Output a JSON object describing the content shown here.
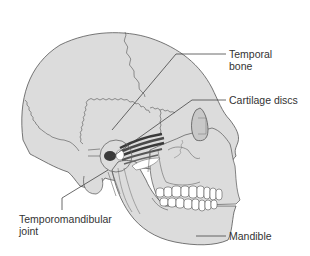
{
  "diagram": {
    "colors": {
      "bone_fill": "#dcdcdc",
      "outline": "#555555",
      "suture": "#666666",
      "muscle": "#3a3a3a",
      "teeth": "#ffffff",
      "leader_line": "#444444",
      "text": "#333333",
      "background": "#ffffff"
    },
    "labels": [
      {
        "id": "temporal-bone",
        "line1": "Temporal",
        "line2": "bone"
      },
      {
        "id": "cartilage-discs",
        "line1": "Cartilage discs"
      },
      {
        "id": "temporomandibular-joint",
        "line1": "Temporomandibular",
        "line2": "joint"
      },
      {
        "id": "mandible",
        "line1": "Mandible"
      }
    ]
  }
}
